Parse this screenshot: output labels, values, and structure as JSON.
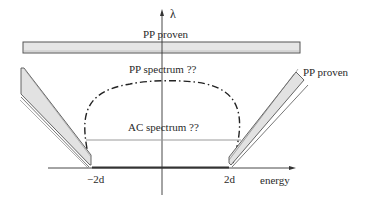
{
  "diagram": {
    "axes": {
      "y_label": "λ",
      "x_label": "energy",
      "x_ticks": [
        "−2d",
        "2d"
      ]
    },
    "regions": {
      "top_band_label": "PP proven",
      "right_wedge_label": "PP proven",
      "pp_unknown_label": "PP spectrum ??",
      "ac_unknown_label": "AC spectrum ??"
    },
    "colors": {
      "band_fill": "#e6e6e6",
      "stroke": "#444444",
      "dashdot": "#222222"
    }
  }
}
